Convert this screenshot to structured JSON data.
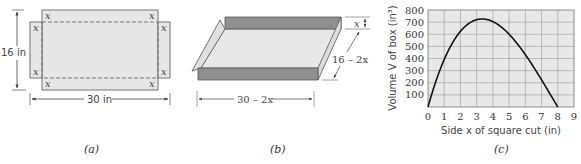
{
  "figure": {
    "panel_a": {
      "caption": "(a)",
      "corner_label": "x",
      "height_label": "16 in",
      "width_label": "30 in"
    },
    "panel_b": {
      "caption": "(b)",
      "height_label": "x",
      "depth_label": "16 – 2x",
      "width_label": "30 – 2x"
    },
    "panel_c": {
      "caption": "(c)"
    },
    "colors": {
      "sheet_fill": "#e6e6e6",
      "wall_fill": "#8f8f8f",
      "grid": "#9a9a9a",
      "curve": "#111111"
    }
  },
  "chart_data": {
    "type": "line",
    "title": "",
    "xlabel": "Side x of square cut (in)",
    "ylabel": "Volume V of box (in³)",
    "xlim": [
      0,
      9
    ],
    "ylim": [
      0,
      800
    ],
    "x_ticks": [
      "0",
      "1",
      "2",
      "3",
      "4",
      "5",
      "6",
      "7",
      "8",
      "9"
    ],
    "y_ticks": [
      "100",
      "200",
      "300",
      "400",
      "500",
      "600",
      "700",
      "800"
    ],
    "grid": true,
    "legend": null,
    "series": [
      {
        "name": "V(x) = x(30 − 2x)(16 − 2x)",
        "x": [
          0,
          0.5,
          1,
          1.5,
          2,
          2.5,
          3,
          3.33,
          3.5,
          4,
          4.5,
          5,
          5.5,
          6,
          6.5,
          7,
          7.5,
          8
        ],
        "values": [
          0,
          217.5,
          392,
          526.5,
          624,
          687.5,
          720,
          725.9,
          724.5,
          704,
          661.5,
          600,
          522.5,
          432,
          331.5,
          224,
          112.5,
          0
        ]
      }
    ]
  }
}
